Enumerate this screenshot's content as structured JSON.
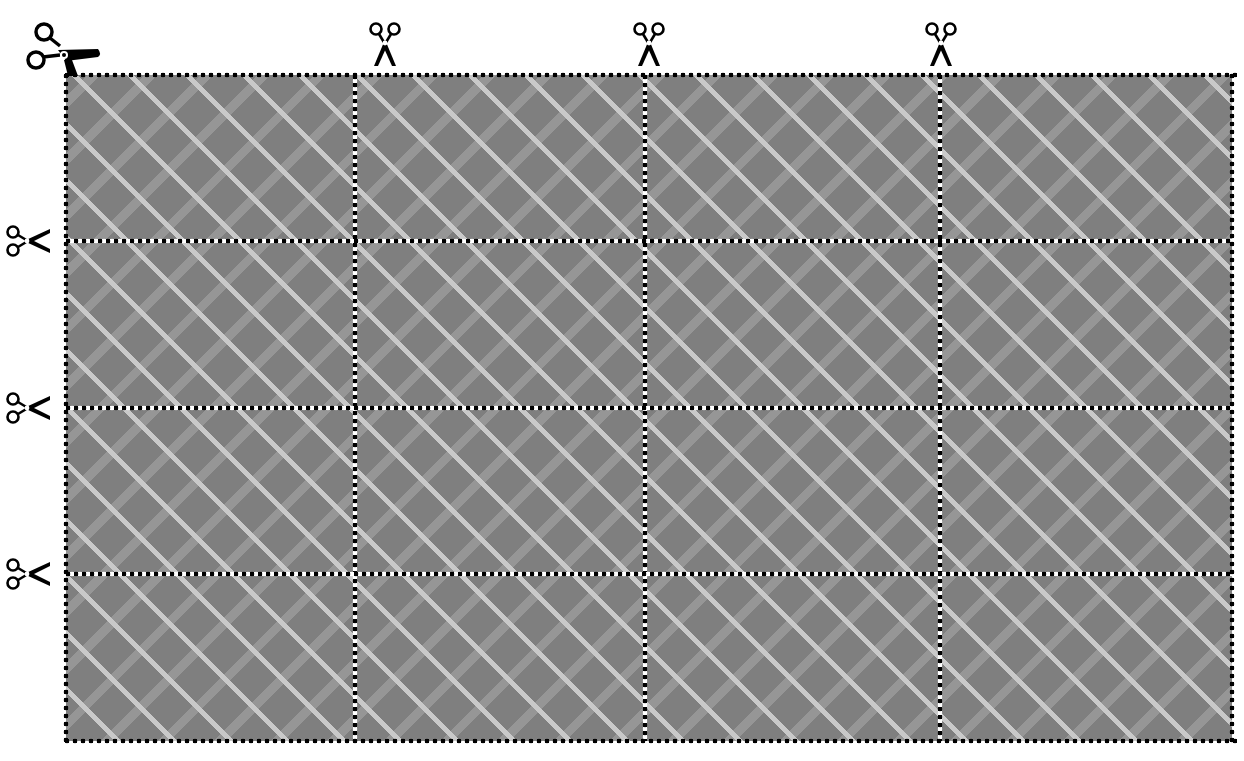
{
  "worksheet": {
    "title": "",
    "grid": {
      "columns": 4,
      "rows": 4,
      "cell_count": 16,
      "column_dividers_x": [
        355,
        645,
        940
      ],
      "row_dividers_y": [
        241,
        408,
        574
      ],
      "bounds": {
        "left": 66,
        "top": 75,
        "right": 1232,
        "bottom": 741
      }
    },
    "pattern": {
      "name": "diagonal-plaid",
      "base_color": "#7f7f7f",
      "thin_stripe_color": "#c9c9c9",
      "wide_band_color": "#969696"
    },
    "cut_line_style": {
      "outer": "black dotted",
      "inner": "alternating black and white dots",
      "dot_color": "#000000"
    },
    "icons": {
      "corner": "scissors-icon",
      "top": [
        "scissors-icon",
        "scissors-icon",
        "scissors-icon"
      ],
      "left": [
        "scissors-icon",
        "scissors-icon",
        "scissors-icon"
      ]
    }
  }
}
